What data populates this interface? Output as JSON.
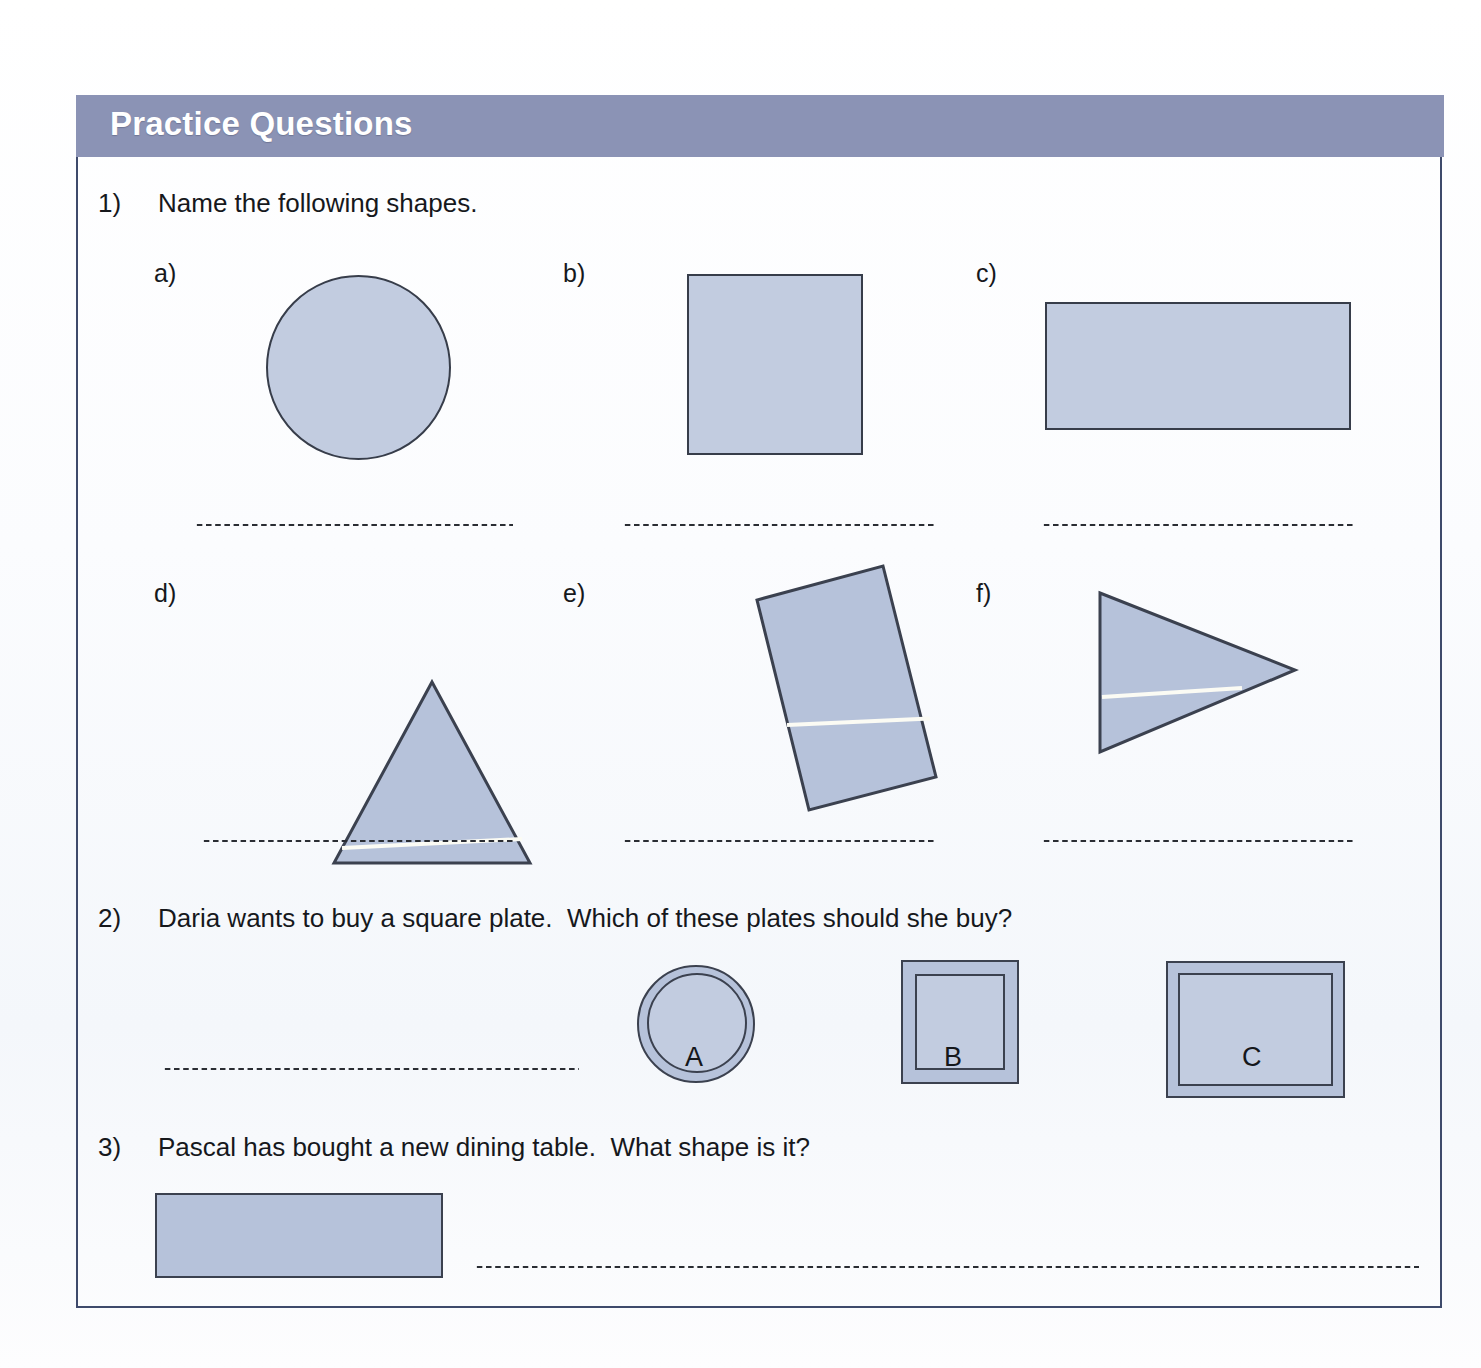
{
  "header": {
    "title": "Practice Questions",
    "bar_color": "#8b93b5",
    "title_color": "#ffffff",
    "border_color": "#3e4a6b"
  },
  "colors": {
    "shape_fill_light": "#c2cce0",
    "shape_fill_dark": "#b6c2da",
    "shape_stroke": "#373d4a",
    "text": "#16181c",
    "page_background": "#ffffff"
  },
  "questions": [
    {
      "number": "1)",
      "text": "Name the following shapes.",
      "parts": [
        {
          "label": "a)",
          "shape": "circle"
        },
        {
          "label": "b)",
          "shape": "square"
        },
        {
          "label": "c)",
          "shape": "rectangle"
        },
        {
          "label": "d)",
          "shape": "triangle"
        },
        {
          "label": "e)",
          "shape": "rotated-rectangle"
        },
        {
          "label": "f)",
          "shape": "right-pointing-triangle"
        }
      ]
    },
    {
      "number": "2)",
      "text": "Daria wants to buy a square plate.  Which of these plates should she buy?",
      "plates": [
        {
          "label": "A",
          "shape": "circle-plate"
        },
        {
          "label": "B",
          "shape": "square-plate"
        },
        {
          "label": "C",
          "shape": "rectangle-plate"
        }
      ]
    },
    {
      "number": "3)",
      "text": "Pascal has bought a new dining table.  What shape is it?",
      "figure": "rectangle"
    }
  ],
  "answer_lines": {
    "count": 8,
    "style": "dotted"
  }
}
